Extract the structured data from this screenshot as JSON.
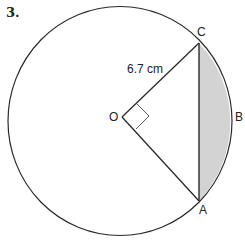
{
  "question_number": "3.",
  "labels": {
    "C": "C",
    "B": "B",
    "A": "A",
    "O": "O",
    "radius": "6.7 cm"
  },
  "colors": {
    "stroke": "#2a2a2a",
    "shaded_segment": "#d3d3d3"
  },
  "geometry": {
    "center": "O",
    "right_angle_at": "O",
    "chord": "AC",
    "shaded_region": "segment ABC"
  }
}
